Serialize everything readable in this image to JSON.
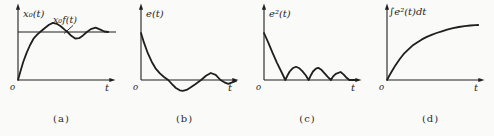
{
  "figure": {
    "background": "#fafaf8",
    "ink": "#1f1f1f",
    "panels": [
      {
        "id": "a",
        "caption": "(a)",
        "y_axis_label": "x₀(t)",
        "x_axis_label": "t",
        "origin_label": "o",
        "annotation": "x₀f(t)",
        "annotation_leader": [
          71,
          25.5,
          62,
          33.5
        ],
        "chart_data": {
          "type": "line",
          "title": "step response with decaying oscillation about steady-state line",
          "xlabel": "t",
          "ylabel": "x₀(t)",
          "x_range": [
            0,
            10
          ],
          "y_range": [
            0,
            1.55
          ],
          "reference_value": 1,
          "y_px_per_unit": 48,
          "points": [
            [
              0,
              0
            ],
            [
              0.25,
              0.18
            ],
            [
              0.55,
              0.38
            ],
            [
              0.9,
              0.57
            ],
            [
              1.25,
              0.73
            ],
            [
              1.6,
              0.86
            ],
            [
              2.0,
              0.95
            ],
            [
              2.4,
              1.02
            ],
            [
              2.8,
              1.09
            ],
            [
              3.2,
              1.15
            ],
            [
              3.6,
              1.19
            ],
            [
              4.0,
              1.17
            ],
            [
              4.4,
              1.12
            ],
            [
              4.8,
              1.05
            ],
            [
              5.1,
              1.0
            ],
            [
              5.5,
              0.92
            ],
            [
              5.9,
              0.865
            ],
            [
              6.3,
              0.87
            ],
            [
              6.7,
              0.93
            ],
            [
              7.1,
              1.0
            ],
            [
              7.5,
              1.06
            ],
            [
              8.0,
              1.09
            ],
            [
              8.5,
              1.05
            ],
            [
              8.9,
              1.01
            ],
            [
              9.3,
              1.0
            ]
          ]
        }
      },
      {
        "id": "b",
        "caption": "(b)",
        "y_axis_label": "e(t)",
        "x_axis_label": "t",
        "origin_label": "o",
        "chart_data": {
          "type": "line",
          "title": "error signal decaying oscillation",
          "xlabel": "t",
          "ylabel": "e(t)",
          "x_range": [
            0,
            10
          ],
          "y_range": [
            -0.3,
            1.55
          ],
          "y_px_per_unit": 47,
          "points": [
            [
              0,
              1.0
            ],
            [
              0.3,
              0.8
            ],
            [
              0.7,
              0.57
            ],
            [
              1.1,
              0.39
            ],
            [
              1.5,
              0.25
            ],
            [
              1.95,
              0.14
            ],
            [
              2.4,
              0.06
            ],
            [
              2.8,
              0
            ],
            [
              3.2,
              -0.09
            ],
            [
              3.6,
              -0.17
            ],
            [
              4.0,
              -0.22
            ],
            [
              4.3,
              -0.23
            ],
            [
              4.7,
              -0.21
            ],
            [
              5.1,
              -0.16
            ],
            [
              5.6,
              -0.09
            ],
            [
              6.2,
              0
            ],
            [
              6.7,
              0.09
            ],
            [
              7.2,
              0.15
            ],
            [
              7.7,
              0.11
            ],
            [
              8.2,
              0
            ],
            [
              8.6,
              -0.05
            ],
            [
              9.0,
              -0.08
            ],
            [
              9.4,
              -0.05
            ],
            [
              9.8,
              -0.02
            ]
          ]
        }
      },
      {
        "id": "c",
        "caption": "(c)",
        "y_axis_label": "e²(t)",
        "x_axis_label": "t",
        "origin_label": "o",
        "chart_data": {
          "type": "line",
          "title": "squared error with decaying humps touching zero",
          "xlabel": "t",
          "ylabel": "e²(t)",
          "x_range": [
            0,
            10
          ],
          "y_range": [
            0,
            1.55
          ],
          "y_px_per_unit": 47,
          "points": [
            [
              0,
              1.0
            ],
            [
              0.45,
              0.79
            ],
            [
              0.9,
              0.57
            ],
            [
              1.35,
              0.36
            ],
            [
              1.8,
              0.17
            ],
            [
              2.2,
              0
            ],
            [
              2.4,
              0.09
            ],
            [
              2.65,
              0.18
            ],
            [
              2.95,
              0.25
            ],
            [
              3.3,
              0.28
            ],
            [
              3.65,
              0.25
            ],
            [
              3.95,
              0.19
            ],
            [
              4.3,
              0.1
            ],
            [
              4.6,
              0
            ],
            [
              4.8,
              0.09
            ],
            [
              5.05,
              0.18
            ],
            [
              5.35,
              0.24
            ],
            [
              5.6,
              0.26
            ],
            [
              5.95,
              0.21
            ],
            [
              6.25,
              0.14
            ],
            [
              6.6,
              0.06
            ],
            [
              6.9,
              0
            ],
            [
              7.1,
              0.07
            ],
            [
              7.4,
              0.13
            ],
            [
              7.9,
              0.17
            ],
            [
              8.2,
              0.12
            ],
            [
              8.45,
              0.06
            ],
            [
              8.8,
              0
            ],
            [
              9.1,
              0
            ],
            [
              9.6,
              0
            ]
          ]
        }
      },
      {
        "id": "d",
        "caption": "(d)",
        "y_axis_label": "∫e²(t)dt",
        "x_axis_label": "t",
        "origin_label": "o",
        "chart_data": {
          "type": "line",
          "title": "integral of squared error rising and saturating",
          "xlabel": "t",
          "ylabel": "∫e²(t)dt",
          "x_range": [
            0,
            10
          ],
          "y_range": [
            0,
            1.3
          ],
          "y_px_per_unit": 56,
          "points": [
            [
              0,
              0
            ],
            [
              0.25,
              0.08
            ],
            [
              0.55,
              0.17
            ],
            [
              0.9,
              0.27
            ],
            [
              1.3,
              0.37
            ],
            [
              1.7,
              0.46
            ],
            [
              2.15,
              0.54
            ],
            [
              2.6,
              0.61
            ],
            [
              3.1,
              0.67
            ],
            [
              3.6,
              0.725
            ],
            [
              4.1,
              0.77
            ],
            [
              4.6,
              0.805
            ],
            [
              5.1,
              0.84
            ],
            [
              5.65,
              0.87
            ],
            [
              6.2,
              0.9
            ],
            [
              6.8,
              0.925
            ],
            [
              7.4,
              0.947
            ],
            [
              8.0,
              0.962
            ],
            [
              8.6,
              0.973
            ],
            [
              9.1,
              0.979
            ],
            [
              9.4,
              0.982
            ]
          ]
        }
      }
    ]
  }
}
